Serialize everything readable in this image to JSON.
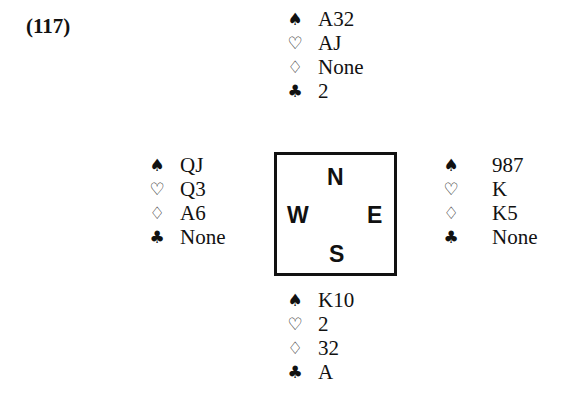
{
  "problem_number": "(117)",
  "compass": {
    "north": "N",
    "south": "S",
    "east": "E",
    "west": "W"
  },
  "suits": {
    "spades": "♠",
    "hearts": "♡",
    "diamonds": "♢",
    "clubs": "♣"
  },
  "hands": {
    "north": {
      "spades": "A32",
      "hearts": "AJ",
      "diamonds": "None",
      "clubs": "2"
    },
    "west": {
      "spades": "QJ",
      "hearts": "Q3",
      "diamonds": "A6",
      "clubs": "None"
    },
    "east": {
      "spades": "987",
      "hearts": "K",
      "diamonds": "K5",
      "clubs": "None"
    },
    "south": {
      "spades": "K10",
      "hearts": "2",
      "diamonds": "32",
      "clubs": "A"
    }
  }
}
